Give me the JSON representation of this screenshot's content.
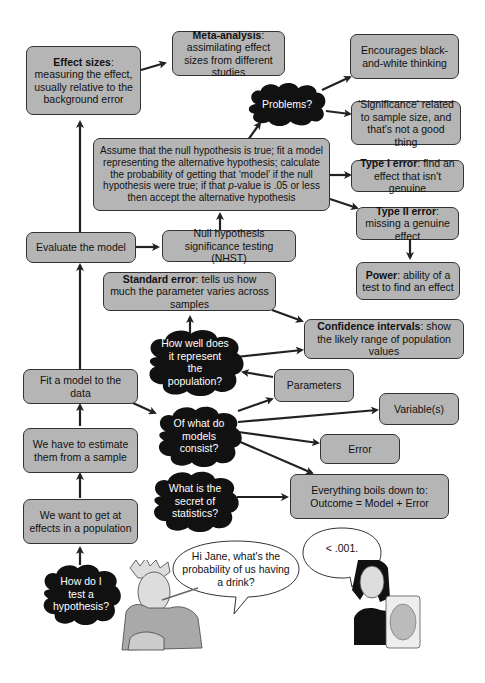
{
  "boxes": {
    "effect_sizes": {
      "bold": "Effect sizes",
      "text": ": measuring the effect, usually relative to the background error"
    },
    "meta_analysis": {
      "bold": "Meta-analysis",
      "text": ": assimilating effect sizes from different studies"
    },
    "black_white": {
      "text": "Encourages black-and-white thinking"
    },
    "significance": {
      "text": "'Significance' related to sample size, and that's not a good thing"
    },
    "assume_null": {
      "text_1": "Assume that the null hypothesis is true; fit a model representing the alternative hypothesis; calculate the probability of getting that ‘model’ if the null hypothesis were true; if that ",
      "italic": "p",
      "text_2": "-value is .05 or less then accept the alternative hypothesis"
    },
    "type1": {
      "bold": "Type I error",
      "text": ": find an effect that isn't genuine"
    },
    "type2": {
      "bold": "Type II error",
      "text": ": missing a genuine effect"
    },
    "power": {
      "bold": "Power",
      "text": ": ability of a test to find an effect"
    },
    "evaluate": {
      "text": "Evaluate the model"
    },
    "nhst": {
      "text": "Null hypothesis significance testing (NHST)"
    },
    "standard_error": {
      "bold": "Standard error",
      "text": ": tells us how much the parameter varies across samples"
    },
    "confidence": {
      "bold": "Confidence intervals",
      "text": ": show the likely range of population values"
    },
    "fit_model": {
      "text": "Fit a model to the data"
    },
    "parameters": {
      "text": "Parameters"
    },
    "variables": {
      "text": "Variable(s)"
    },
    "error": {
      "text": "Error"
    },
    "estimate": {
      "text": "We have to estimate them from a sample"
    },
    "outcome": {
      "text_1": "Everything boils down to:",
      "text_2": "Outcome = Model + Error"
    },
    "effects_population": {
      "text": "We want to get at effects in a population"
    }
  },
  "clouds": {
    "problems": "Problems?",
    "how_well": "How well does it represent the population?",
    "of_what": "Of what do models consist?",
    "secret": "What is the secret of statistics?",
    "how_do_i": "How do I test a hypothesis?"
  },
  "bubbles": {
    "left": "Hi Jane, what's the probability of us having a drink?",
    "right": "< .001."
  },
  "colors": {
    "box_fill": "#b5b5b5",
    "cloud_fill": "#111111",
    "arrow": "#222222"
  }
}
